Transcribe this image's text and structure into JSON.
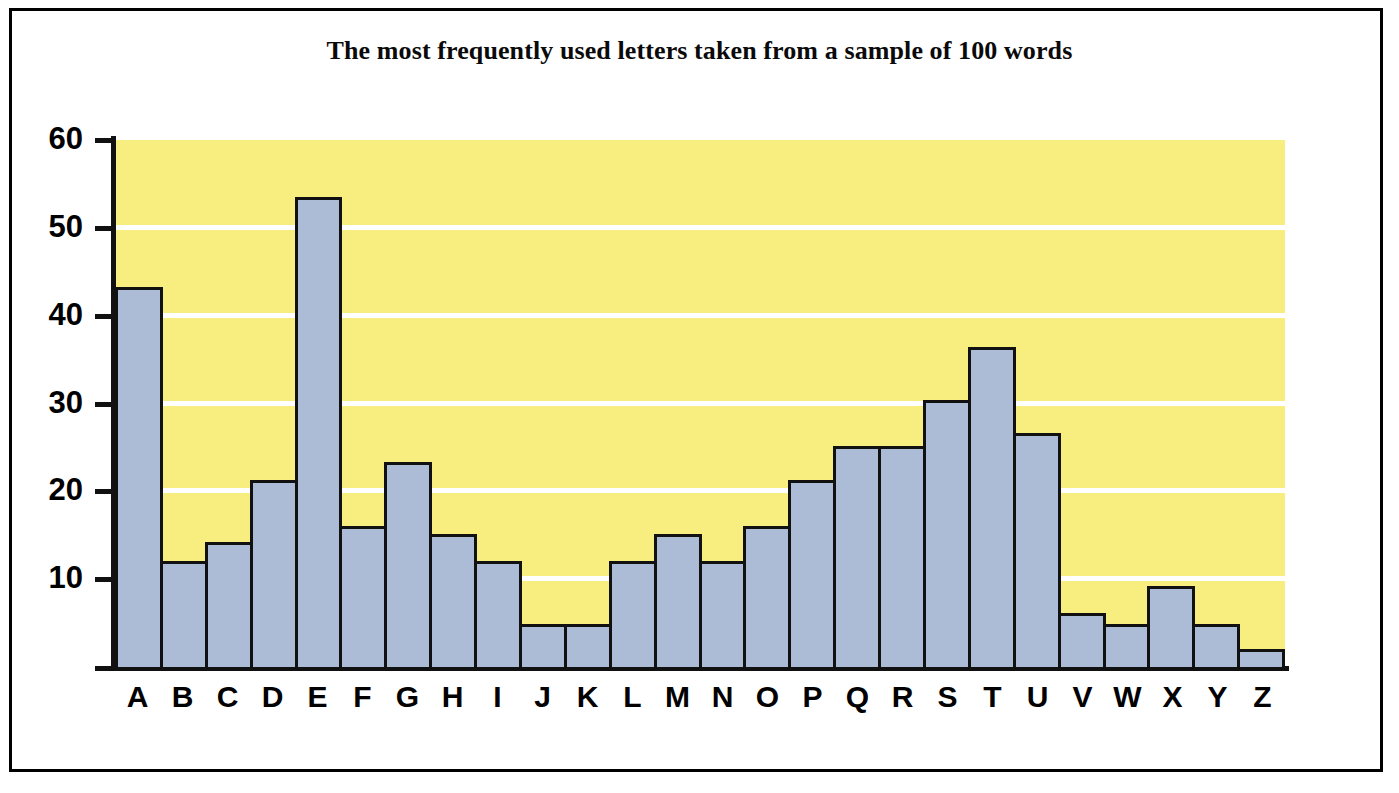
{
  "frame": {
    "border_color": "#000000"
  },
  "chart_data": {
    "type": "bar",
    "title": "The most frequently used letters taken from a sample of 100 words",
    "xlabel": "",
    "ylabel": "",
    "categories": [
      "A",
      "B",
      "C",
      "D",
      "E",
      "F",
      "G",
      "H",
      "I",
      "J",
      "K",
      "L",
      "M",
      "N",
      "O",
      "P",
      "Q",
      "R",
      "S",
      "T",
      "U",
      "V",
      "W",
      "X",
      "Y",
      "Z"
    ],
    "values": [
      43.3,
      12.1,
      14.2,
      21.3,
      53.5,
      16.1,
      23.3,
      15.2,
      12.1,
      4.9,
      4.9,
      12.1,
      15.2,
      12.1,
      16.1,
      21.3,
      25.2,
      25.2,
      30.4,
      36.4,
      26.6,
      6.1,
      4.9,
      9.2,
      4.9,
      2.0
    ],
    "ylim": [
      0,
      60
    ],
    "yticks": [
      10,
      20,
      30,
      40,
      50,
      60
    ],
    "ytick_labels": [
      "10",
      "20",
      "30",
      "40",
      "50",
      "60"
    ],
    "grid": true,
    "grid_color": "#ffffff",
    "legend": false,
    "plot_background": "#f7ee7f",
    "bar_fill": "#adbcd6",
    "bar_edge": "#111111",
    "axis_color": "#111111"
  }
}
